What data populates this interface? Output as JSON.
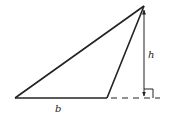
{
  "diagram": {
    "type": "triangle-area-diagram",
    "colors": {
      "stroke": "#222222",
      "background": "#ffffff"
    },
    "labels": {
      "base": "b",
      "height": "h"
    },
    "vertices": {
      "bottom_left": [
        15,
        98
      ],
      "bottom_right": [
        107,
        98
      ],
      "apex": [
        144,
        6
      ]
    },
    "height_line": {
      "from": [
        144,
        6
      ],
      "to": [
        144,
        98
      ],
      "arrows": "both"
    },
    "base_extension": {
      "style": "dashed",
      "from": [
        110,
        98
      ],
      "to": [
        160,
        98
      ]
    },
    "right_angle_marker": {
      "x": 144,
      "y": 89,
      "size": 9
    }
  }
}
